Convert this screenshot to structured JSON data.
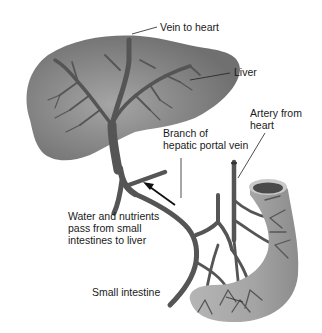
{
  "diagram": {
    "colors": {
      "background": "#ffffff",
      "liver": "#7a7a7a",
      "liver_light": "#9a9a9a",
      "vessel": "#555555",
      "intestine": "#a8a8a8",
      "intestine_dark": "#8a8a8a",
      "intestine_lumen": "#4a4a4a",
      "text": "#1a1a1a",
      "leader_line": "#222222"
    },
    "labels": {
      "vein_to_heart": "Vein to heart",
      "liver": "Liver",
      "artery_from_heart": "Artery from\nheart",
      "branch_portal_vein": "Branch of\nhepatic portal vein",
      "water_nutrients": "Water and nutrients\npass from small\nintestines to liver",
      "small_intestine": "Small intestine"
    },
    "nodes": [
      {
        "id": "liver",
        "label": "Liver"
      },
      {
        "id": "vein_to_heart",
        "label": "Vein to heart"
      },
      {
        "id": "hepatic_portal_vein",
        "label": "Branch of hepatic portal vein"
      },
      {
        "id": "artery_from_heart",
        "label": "Artery from heart"
      },
      {
        "id": "small_intestine",
        "label": "Small intestine"
      }
    ],
    "edges": [
      {
        "from": "small_intestine",
        "to": "liver",
        "label": "Water and nutrients pass from small intestines to liver"
      }
    ]
  }
}
